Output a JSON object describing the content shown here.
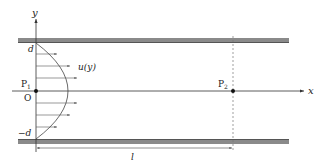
{
  "diagram": {
    "axes": {
      "y_label": "y",
      "x_label": "x",
      "origin_label": "O"
    },
    "points": {
      "p1": {
        "label": "P",
        "sub": "1"
      },
      "p2": {
        "label": "P",
        "sub": "2"
      }
    },
    "labels": {
      "d_top": "d",
      "d_bottom": "−d",
      "velocity": "u(y)",
      "length": "l"
    },
    "colors": {
      "wall": "#8a8a8a",
      "wall_edge": "#555555",
      "line": "#333333",
      "dashed": "#777777"
    }
  }
}
